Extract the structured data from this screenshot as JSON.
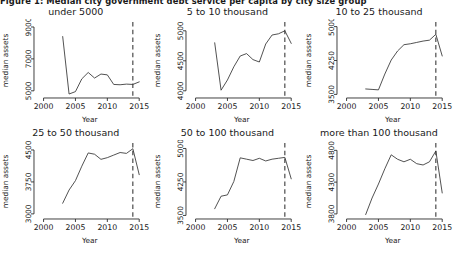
{
  "figure": {
    "caption": "Figure 1: Median city government debt service per capita by city size group",
    "axis_labels": {
      "x": "Year",
      "y": "median assets"
    },
    "xticks": [
      2000,
      2005,
      2010,
      2015
    ],
    "xlim": [
      1998.5,
      2016.0
    ],
    "reference_line_year": 2014,
    "colors": {
      "line": "#333333",
      "axis": "#2b2b2b",
      "reference": "#3a3a3a",
      "background": "#ffffff"
    }
  },
  "chart_data": [
    {
      "type": "line",
      "title": "under 5000",
      "xlabel": "Year",
      "ylabel": "median assets",
      "xticks": [
        2000,
        2005,
        2010,
        2015
      ],
      "yticks": [
        5000,
        7000,
        9000
      ],
      "xlim": [
        1998.5,
        2016.0
      ],
      "ylim": [
        4550,
        9250
      ],
      "grid": false,
      "legend": "none",
      "annotations": [
        {
          "type": "vline",
          "x": 2014,
          "style": "dashed"
        }
      ],
      "x": [
        2003,
        2004,
        2005,
        2006,
        2007,
        2008,
        2009,
        2010,
        2011,
        2012,
        2013,
        2014,
        2015
      ],
      "values": [
        8400,
        4800,
        4950,
        5750,
        6150,
        5800,
        6050,
        6000,
        5400,
        5380,
        5420,
        5400,
        5560
      ]
    },
    {
      "type": "line",
      "title": "5 to 10 thousand",
      "xlabel": "Year",
      "ylabel": "median assets",
      "xticks": [
        2000,
        2005,
        2010,
        2015
      ],
      "yticks": [
        4000,
        4500,
        5000
      ],
      "xlim": [
        1998.5,
        2016.0
      ],
      "ylim": [
        3880,
        5130
      ],
      "grid": false,
      "legend": "none",
      "annotations": [
        {
          "type": "vline",
          "x": 2014,
          "style": "dashed"
        }
      ],
      "x": [
        2003,
        2004,
        2005,
        2006,
        2007,
        2008,
        2009,
        2010,
        2011,
        2012,
        2013,
        2014,
        2015
      ],
      "values": [
        4800,
        4010,
        4180,
        4400,
        4580,
        4620,
        4520,
        4480,
        4780,
        4930,
        4950,
        5000,
        4790
      ]
    },
    {
      "type": "line",
      "title": "10 to 25 thousand",
      "xlabel": "Year",
      "ylabel": "median assets",
      "xticks": [
        2000,
        2005,
        2010,
        2015
      ],
      "yticks": [
        3500,
        4250,
        5000
      ],
      "xlim": [
        1998.5,
        2016.0
      ],
      "ylim": [
        3420,
        5080
      ],
      "grid": false,
      "legend": "none",
      "annotations": [
        {
          "type": "vline",
          "x": 2014,
          "style": "dashed"
        }
      ],
      "x": [
        2003,
        2004,
        2005,
        2006,
        2007,
        2008,
        2009,
        2010,
        2011,
        2012,
        2013,
        2014,
        2015
      ],
      "values": [
        3620,
        3610,
        3600,
        3950,
        4260,
        4460,
        4600,
        4620,
        4650,
        4680,
        4700,
        4830,
        4350
      ]
    },
    {
      "type": "line",
      "title": "25 to 50 thousand",
      "xlabel": "Year",
      "ylabel": "median assets",
      "xticks": [
        2000,
        2005,
        2010,
        2015
      ],
      "yticks": [
        3000,
        3750,
        4500
      ],
      "xlim": [
        1998.5,
        2016.0
      ],
      "ylim": [
        2880,
        4640
      ],
      "grid": false,
      "legend": "none",
      "annotations": [
        {
          "type": "vline",
          "x": 2014,
          "style": "dashed"
        }
      ],
      "x": [
        2003,
        2004,
        2005,
        2006,
        2007,
        2008,
        2009,
        2010,
        2011,
        2012,
        2013,
        2014,
        2015
      ],
      "values": [
        3250,
        3560,
        3780,
        4120,
        4430,
        4400,
        4280,
        4320,
        4380,
        4440,
        4420,
        4530,
        3920
      ]
    },
    {
      "type": "line",
      "title": "50 to 100 thousand",
      "xlabel": "Year",
      "ylabel": "median assets",
      "xticks": [
        2000,
        2005,
        2010,
        2015
      ],
      "yticks": [
        3500,
        4250,
        5000
      ],
      "xlim": [
        1998.5,
        2016.0
      ],
      "ylim": [
        3420,
        5100
      ],
      "grid": false,
      "legend": "none",
      "annotations": [
        {
          "type": "vline",
          "x": 2014,
          "style": "dashed"
        }
      ],
      "x": [
        2003,
        2004,
        2005,
        2006,
        2007,
        2008,
        2009,
        2010,
        2011,
        2012,
        2013,
        2014,
        2015
      ],
      "values": [
        3650,
        3930,
        3960,
        4260,
        4790,
        4760,
        4730,
        4780,
        4720,
        4760,
        4780,
        4800,
        4320
      ]
    },
    {
      "type": "line",
      "title": "more than 100 thousand",
      "xlabel": "Year",
      "ylabel": "median assets",
      "xticks": [
        2000,
        2005,
        2010,
        2015
      ],
      "yticks": [
        3800,
        4300,
        4800
      ],
      "xlim": [
        1998.5,
        2016.0
      ],
      "ylim": [
        3720,
        4900
      ],
      "grid": false,
      "legend": "none",
      "annotations": [
        {
          "type": "vline",
          "x": 2014,
          "style": "dashed"
        }
      ],
      "x": [
        2003,
        2004,
        2005,
        2006,
        2007,
        2008,
        2009,
        2010,
        2011,
        2012,
        2013,
        2014,
        2015
      ],
      "values": [
        3790,
        4050,
        4270,
        4510,
        4730,
        4660,
        4620,
        4660,
        4590,
        4570,
        4620,
        4790,
        4130
      ]
    }
  ]
}
